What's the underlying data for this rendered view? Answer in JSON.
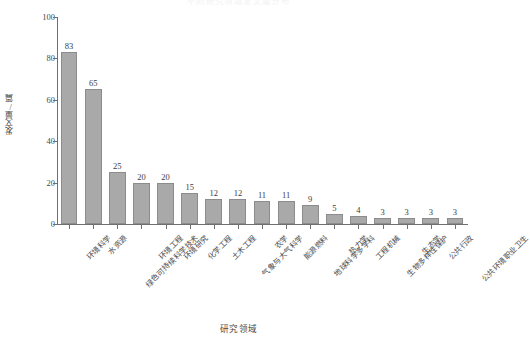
{
  "chart_data": {
    "type": "bar",
    "title": "不同研究领域发文量分布",
    "xlabel": "研究领域",
    "ylabel": "发文量/篇",
    "ylim": [
      0,
      100
    ],
    "yticks": [
      0,
      20,
      40,
      60,
      80,
      100
    ],
    "grid": false,
    "legend": null,
    "categories": [
      "环境科学",
      "水资源",
      "绿色可持续科学技术",
      "环境工程",
      "环境研究",
      "化学工程",
      "土木工程",
      "气象与大气科学",
      "农学",
      "能源燃料",
      "地球科学多学科",
      "热力学",
      "工程机械",
      "生物多样性保护",
      "生态学",
      "公共行政",
      "公共环境职业卫生"
    ],
    "values": [
      83,
      65,
      25,
      20,
      20,
      15,
      12,
      12,
      11,
      11,
      9,
      5,
      4,
      3,
      3,
      3,
      3
    ],
    "bar_color": "#a9a9a9",
    "bar_edge_color": "#8c8c8c",
    "axis_color": "#6f6f6f",
    "text_color": "#4a4a4a",
    "background": "#ffffff"
  }
}
